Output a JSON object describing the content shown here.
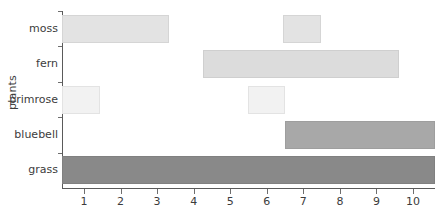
{
  "chart_data": {
    "type": "bar",
    "orientation": "horizontal",
    "subtype": "floating-range-bar",
    "title": "",
    "xlabel": "",
    "ylabel": "plants",
    "categories": [
      "grass",
      "bluebell",
      "primrose",
      "fern",
      "moss"
    ],
    "xlim": [
      0.4,
      10.6
    ],
    "xticks": [
      1,
      2,
      3,
      4,
      5,
      6,
      7,
      8,
      9,
      10
    ],
    "xtick_labels": [
      "1",
      "2",
      "3",
      "4",
      "5",
      "6",
      "7",
      "8",
      "9",
      "10"
    ],
    "grid": false,
    "legend": "none",
    "bars": [
      {
        "category": "grass",
        "color": "#898989",
        "segments": [
          {
            "start": 0.4,
            "end": 10.6
          }
        ]
      },
      {
        "category": "bluebell",
        "color": "#a8a8a8",
        "segments": [
          {
            "start": 6.5,
            "end": 10.6
          }
        ]
      },
      {
        "category": "primrose",
        "color": "#f2f2f2",
        "segments": [
          {
            "start": 0.4,
            "end": 1.45
          },
          {
            "start": 5.48,
            "end": 6.5
          }
        ]
      },
      {
        "category": "fern",
        "color": "#dcdcdc",
        "segments": [
          {
            "start": 4.25,
            "end": 9.62
          }
        ]
      },
      {
        "category": "moss",
        "color": "#e3e3e3",
        "segments": [
          {
            "start": 0.4,
            "end": 3.33
          },
          {
            "start": 6.45,
            "end": 7.48
          }
        ]
      }
    ]
  },
  "axis": {
    "y_title": "plants",
    "axis_color": "#5a5a5a",
    "tick_color": "#6e6e6e",
    "text_color": "#3c3c3c"
  },
  "labels": {
    "moss": "moss",
    "fern": "fern",
    "primrose": "primrose",
    "bluebell": "bluebell",
    "grass": "grass"
  }
}
